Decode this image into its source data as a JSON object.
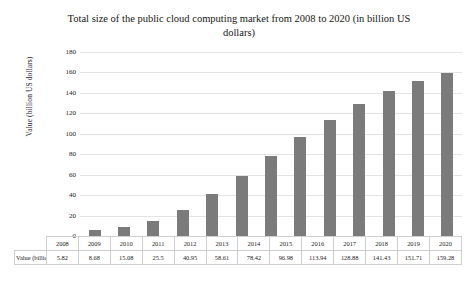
{
  "chart_data": {
    "type": "bar",
    "title": "Total size of the public cloud computing market from 2008 to 2020 (in billion US dollars)",
    "xlabel": "",
    "ylabel": "Value (billion US dollars)",
    "ylim": [
      0,
      180
    ],
    "yticks": [
      180,
      160,
      140,
      120,
      100,
      80,
      60,
      40,
      20,
      0
    ],
    "grid": true,
    "legend": "none",
    "bar_color": "#7b7b7b",
    "gridline_color": "#e3e3e3",
    "categories": [
      "2008",
      "2009",
      "2010",
      "2011",
      "2012",
      "2013",
      "2014",
      "2015",
      "2016",
      "2017",
      "2018",
      "2019",
      "2020"
    ],
    "values": [
      5.82,
      8.68,
      15.08,
      25.5,
      40.95,
      58.61,
      78.42,
      96.98,
      113.94,
      128.88,
      141.43,
      151.71,
      159.28
    ],
    "value_labels": [
      "5.82",
      "8.68",
      "15.08",
      "25.5",
      "40.95",
      "58.61",
      "78.42",
      "96.98",
      "113.94",
      "128.88",
      "141.43",
      "151.71",
      "159.28"
    ]
  },
  "table": {
    "row_header": "Value (billion US dollars)"
  }
}
